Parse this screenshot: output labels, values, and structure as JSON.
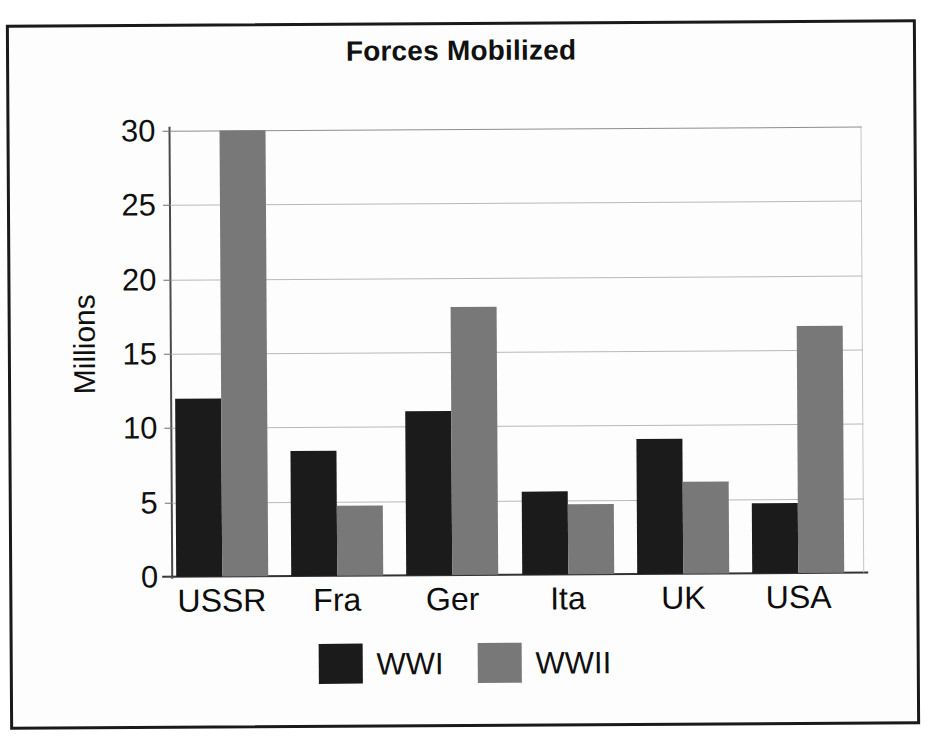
{
  "chart_data": {
    "type": "bar",
    "title": "Forces Mobilized",
    "xlabel": "",
    "ylabel": "Millions",
    "ylim": [
      0,
      30
    ],
    "yticks": [
      0,
      5,
      10,
      15,
      20,
      25,
      30
    ],
    "ytick_labels": [
      "0",
      "5",
      "10",
      "15",
      "20",
      "25",
      "30"
    ],
    "grid": true,
    "legend_position": "bottom",
    "categories": [
      "USSR",
      "Fra",
      "Ger",
      "Ita",
      "UK",
      "USA"
    ],
    "series": [
      {
        "name": "WWI",
        "color": "#1b1b1b",
        "values": [
          12.0,
          8.4,
          11.0,
          5.6,
          9.1,
          4.7
        ]
      },
      {
        "name": "WWII",
        "color": "#787878",
        "values": [
          30.0,
          4.7,
          18.0,
          4.7,
          6.2,
          16.6
        ]
      }
    ]
  },
  "figure": {
    "background_color": "#ffffff",
    "frame_color": "#1a1a1a",
    "gridline_color": "#b9b9b9",
    "axis_color": "#333333"
  }
}
